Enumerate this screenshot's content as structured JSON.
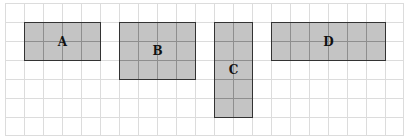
{
  "diagram": {
    "grid": {
      "columns": 21,
      "rows": 7,
      "cell_px": 19,
      "line_color": "#dcdcdc"
    },
    "fill_color": "#c4c4c4",
    "shapes": [
      {
        "label": "A",
        "col": 1,
        "row": 1,
        "width_cells": 4,
        "height_cells": 2
      },
      {
        "label": "B",
        "col": 6,
        "row": 1,
        "width_cells": 4,
        "height_cells": 3
      },
      {
        "label": "C",
        "col": 11,
        "row": 1,
        "width_cells": 2,
        "height_cells": 5
      },
      {
        "label": "D",
        "col": 14,
        "row": 1,
        "width_cells": 6,
        "height_cells": 2
      }
    ]
  }
}
